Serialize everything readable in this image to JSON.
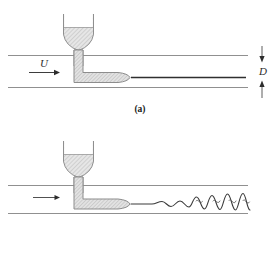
{
  "figure": {
    "type": "reynolds-dye-streak-experiment",
    "panels": [
      {
        "id": "a",
        "caption": "(a)",
        "regime": "laminar",
        "labels": {
          "velocity": "U",
          "diameter": "D"
        },
        "icons": {
          "flow_arrow": "right-arrow-icon",
          "diameter_arrow_top": "down-arrow-icon",
          "diameter_arrow_bottom": "up-arrow-icon",
          "funnel": "funnel-icon",
          "dye_streak": "straight-streak-icon"
        }
      },
      {
        "id": "b",
        "caption": "(b)",
        "regime": "turbulent",
        "labels": {
          "velocity": "",
          "diameter": ""
        },
        "icons": {
          "flow_arrow": "right-arrow-icon",
          "funnel": "funnel-icon",
          "dye_streak": "wavy-streak-icon"
        }
      }
    ]
  },
  "colors": {
    "pipe_wall": "#8e8e8e",
    "outline": "#8a8a8a",
    "hatch_fill": "#d9d9d9",
    "streak": "#3a3a3a",
    "text": "#1a1a1a",
    "background": "#ffffff"
  }
}
